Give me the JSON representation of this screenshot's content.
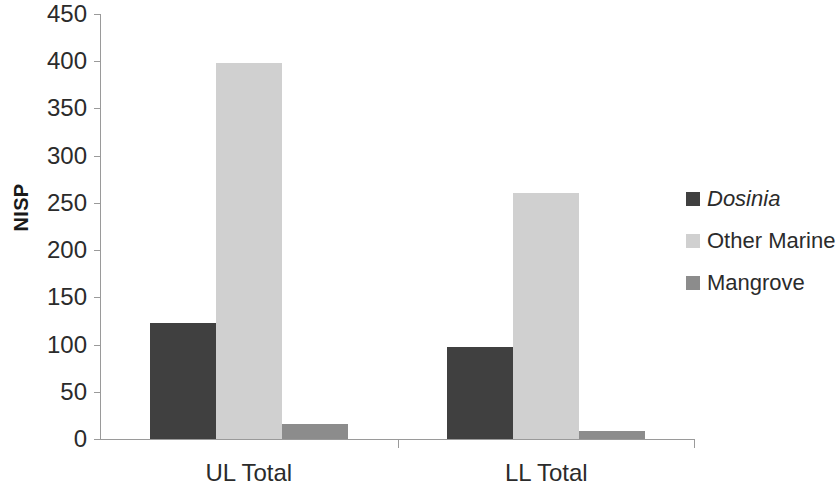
{
  "chart_data": {
    "type": "bar",
    "title": "",
    "subtitle": "",
    "xlabel": "",
    "ylabel": "NISP",
    "categories": [
      "UL Total",
      "LL Total"
    ],
    "ylim": [
      0,
      450
    ],
    "yticks": [
      0,
      50,
      100,
      150,
      200,
      250,
      300,
      350,
      400,
      450
    ],
    "ytick_labels": [
      "0",
      "50",
      "100",
      "150",
      "200",
      "250",
      "300",
      "350",
      "400",
      "450"
    ],
    "grid": false,
    "legend_position": "right",
    "series": [
      {
        "name": "Dosinia",
        "values": [
          123,
          97
        ],
        "color": "#404040",
        "italic": true
      },
      {
        "name": "Other Marine",
        "values": [
          398,
          260
        ],
        "color": "#d0d0d0",
        "italic": false
      },
      {
        "name": "Mangrove",
        "values": [
          16,
          9
        ],
        "color": "#8c8c8c",
        "italic": false
      }
    ]
  }
}
